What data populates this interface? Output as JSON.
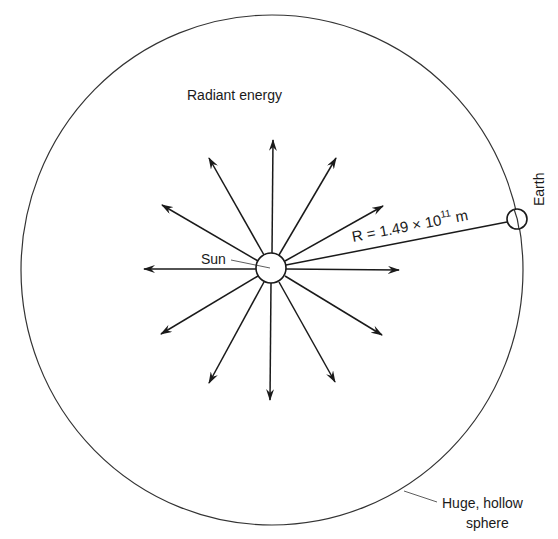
{
  "diagram": {
    "labels": {
      "radiant_energy": "Radiant energy",
      "sun": "Sun",
      "earth": "Earth",
      "radius_prefix": "R = 1.49 × 10",
      "radius_exponent": "11",
      "radius_unit": " m",
      "sphere_line1": "Huge, hollow",
      "sphere_line2": "sphere"
    },
    "colors": {
      "stroke": "#1a1a1a",
      "background": "#ffffff"
    },
    "geometry": {
      "sun_center": [
        271,
        268
      ],
      "sun_radius": 15,
      "sphere_center": [
        272,
        270
      ],
      "sphere_radii": [
        251,
        255
      ],
      "earth_center": [
        517,
        219
      ],
      "earth_radius": 10,
      "arrow_count": 12
    }
  }
}
